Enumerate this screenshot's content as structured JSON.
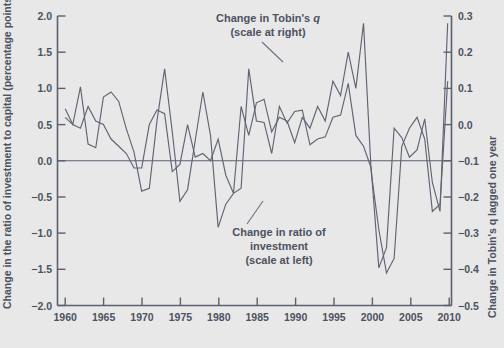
{
  "chart_data": {
    "type": "line",
    "title": "",
    "subtitle": "",
    "xlabel": "",
    "ylabel": "Change in the ratio of investment to capital (percentage points)",
    "y2label": "Change in Tobin's q lagged one year",
    "xlim": [
      1959,
      2010.5
    ],
    "ylim": [
      -2.0,
      2.0
    ],
    "y2lim": [
      -0.5,
      0.3
    ],
    "grid": false,
    "legend_position": "inline-annotations",
    "xticks": [
      1960,
      1965,
      1970,
      1975,
      1980,
      1985,
      1990,
      1995,
      2000,
      2005,
      2010
    ],
    "xtick_labels": [
      "1960",
      "1965",
      "1970",
      "1975",
      "1980",
      "1985",
      "1990",
      "1995",
      "2000",
      "2005",
      "2010"
    ],
    "yticks": [
      -2.0,
      -1.5,
      -1.0,
      -0.5,
      0.0,
      0.5,
      1.0,
      1.5,
      2.0
    ],
    "ytick_labels": [
      "−2.0",
      "−1.5",
      "−1.0",
      "−0.5",
      "0.0",
      "0.5",
      "1.0",
      "1.5",
      "2.0"
    ],
    "y2ticks": [
      -0.5,
      -0.4,
      -0.3,
      -0.2,
      -0.1,
      0.0,
      0.1,
      0.2,
      0.3
    ],
    "y2tick_labels": [
      "−0.5",
      "−0.4",
      "−0.3",
      "−0.2",
      "−0.1",
      "0.0",
      "0.1",
      "0.2",
      "0.3"
    ],
    "zero_reference_line": 0.0,
    "series": [
      {
        "name": "Change in ratio of investment",
        "axis": "left",
        "x": [
          1960,
          1961,
          1962,
          1963,
          1964,
          1965,
          1966,
          1967,
          1968,
          1969,
          1970,
          1971,
          1972,
          1973,
          1974,
          1975,
          1976,
          1977,
          1978,
          1979,
          1980,
          1981,
          1982,
          1983,
          1984,
          1985,
          1986,
          1987,
          1988,
          1989,
          1990,
          1991,
          1992,
          1993,
          1994,
          1995,
          1996,
          1997,
          1998,
          1999,
          2000,
          2001,
          2002,
          2003,
          2004,
          2005,
          2006,
          2007,
          2008,
          2009,
          2010
        ],
        "values": [
          0.72,
          0.5,
          1.02,
          0.23,
          0.18,
          0.88,
          0.95,
          0.82,
          0.44,
          0.12,
          -0.42,
          -0.38,
          0.55,
          1.27,
          0.4,
          -0.56,
          -0.4,
          0.28,
          0.95,
          0.35,
          -0.92,
          -0.6,
          -0.45,
          -0.38,
          1.27,
          0.55,
          0.53,
          0.1,
          0.75,
          0.52,
          0.68,
          0.7,
          0.22,
          0.3,
          0.33,
          0.6,
          0.63,
          1.07,
          0.35,
          0.2,
          -0.1,
          -1.48,
          -1.2,
          0.45,
          0.32,
          0.05,
          0.15,
          0.58,
          -0.3,
          -0.7,
          1.9
        ]
      },
      {
        "name": "Change in Tobin's q",
        "axis": "right",
        "x": [
          1960,
          1961,
          1962,
          1963,
          1964,
          1965,
          1966,
          1967,
          1968,
          1969,
          1970,
          1971,
          1972,
          1973,
          1974,
          1975,
          1976,
          1977,
          1978,
          1979,
          1980,
          1981,
          1982,
          1983,
          1984,
          1985,
          1986,
          1987,
          1988,
          1989,
          1990,
          1991,
          1992,
          1993,
          1994,
          1995,
          1996,
          1997,
          1998,
          1999,
          2000,
          2001,
          2002,
          2003,
          2004,
          2005,
          2006,
          2007,
          2008,
          2009,
          2010
        ],
        "values": [
          0.02,
          0.0,
          -0.01,
          0.05,
          0.01,
          0.0,
          -0.04,
          -0.06,
          -0.08,
          -0.12,
          -0.12,
          0.0,
          0.04,
          0.03,
          -0.13,
          -0.11,
          0.0,
          -0.09,
          -0.08,
          -0.1,
          -0.04,
          -0.14,
          -0.19,
          0.05,
          -0.03,
          0.06,
          0.07,
          -0.02,
          0.02,
          0.01,
          -0.05,
          0.02,
          -0.01,
          0.05,
          0.01,
          0.12,
          0.08,
          0.2,
          0.1,
          0.28,
          -0.13,
          -0.29,
          -0.41,
          -0.37,
          -0.06,
          -0.01,
          0.02,
          -0.04,
          -0.24,
          -0.22,
          0.12
        ]
      }
    ],
    "annotations": [
      {
        "id": "tobins-q-annotation",
        "lines": [
          "Change in Tobin's q",
          "(scale at right)"
        ],
        "target_series": "Change in Tobin's q"
      },
      {
        "id": "investment-annotation",
        "lines": [
          "Change in ratio of",
          "investment",
          "(scale at left)"
        ],
        "target_series": "Change in ratio of investment"
      }
    ]
  },
  "labels": {
    "ylabel": "Change in the ratio of investment to capital (percentage points)",
    "y2label": "Change in Tobin's q lagged one year",
    "annot_q_line1_pre": "Change in Tobin's ",
    "annot_q_line1_ital": "q",
    "annot_q_line2": "(scale at right)",
    "annot_inv_line1": "Change in ratio of",
    "annot_inv_line2": "investment",
    "annot_inv_line3": "(scale at left)",
    "ytick_0": "2.0",
    "ytick_1": "1.5",
    "ytick_2": "1.0",
    "ytick_3": "0.5",
    "ytick_4": "0.0",
    "ytick_5": "−0.5",
    "ytick_6": "−1.0",
    "ytick_7": "−1.5",
    "ytick_8": "−2.0",
    "y2tick_0": "0.3",
    "y2tick_1": "0.2",
    "y2tick_2": "0.1",
    "y2tick_3": "0.0",
    "y2tick_4": "−0.1",
    "y2tick_5": "−0.2",
    "y2tick_6": "−0.3",
    "y2tick_7": "−0.4",
    "y2tick_8": "−0.5",
    "xtick_0": "1960",
    "xtick_1": "1965",
    "xtick_2": "1970",
    "xtick_3": "1975",
    "xtick_4": "1980",
    "xtick_5": "1985",
    "xtick_6": "1990",
    "xtick_7": "1995",
    "xtick_8": "2000",
    "xtick_9": "2005",
    "xtick_10": "2010"
  },
  "colors": {
    "background": "#e8e8e8",
    "line": "#5f6472",
    "axis": "#5a6070",
    "text": "#4c5260"
  }
}
